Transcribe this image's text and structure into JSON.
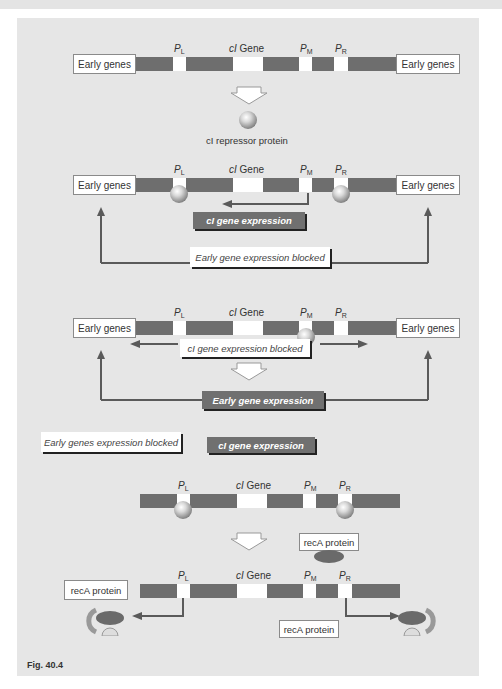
{
  "figure_label": "Fig. 40.4",
  "genes": {
    "early_genes": "Early genes",
    "cI_gene_prefix": "cI",
    "cI_gene_suffix": " Gene",
    "promoters": {
      "PL": {
        "p": "P",
        "sub": "L"
      },
      "PM": {
        "p": "P",
        "sub": "M"
      },
      "PR": {
        "p": "P",
        "sub": "R"
      }
    }
  },
  "panel1": {
    "repressor_label": "cI repressor protein"
  },
  "panel2": {
    "cI_expression": "cI gene expression",
    "early_blocked": "Early gene expression blocked"
  },
  "panel3": {
    "cI_blocked": "cI gene expression blocked",
    "early_expression": "Early gene expression"
  },
  "panel4": {
    "early_blocked": "Early genes expression blocked",
    "cI_expression": "cI gene expression",
    "recA_label": "recA protein",
    "recA_left": "recA protein",
    "recA_right": "recA protein"
  },
  "colors": {
    "panel_bg": "#e6e6e6",
    "dna_bar": "#6e6e6e",
    "dark_label": "#707070",
    "arrow": "#5a5a5a"
  }
}
